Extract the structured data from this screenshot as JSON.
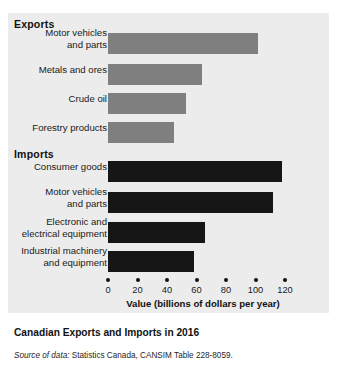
{
  "caption": "Canadian Exports and Imports in 2016",
  "source": {
    "lead": "Source of data:",
    "text": " Statistics Canada, CANSIM Table 228-8059."
  },
  "groups": {
    "exports_label": "Exports",
    "imports_label": "Imports"
  },
  "axis": {
    "title": "Value (billions of dollars per year)",
    "ticks": [
      "0",
      "20",
      "40",
      "60",
      "80",
      "100",
      "120"
    ]
  },
  "colors": {
    "panel": "#ececec",
    "export_bar": "#7f7f7f",
    "import_bar": "#161616",
    "text": "#1a1a1a"
  },
  "chart_data": {
    "type": "bar",
    "orientation": "horizontal",
    "title": "Canadian Exports and Imports in 2016",
    "xlabel": "Value (billions of dollars per year)",
    "ylabel": "",
    "xlim": [
      0,
      120
    ],
    "xticks": [
      0,
      20,
      40,
      60,
      80,
      100,
      120
    ],
    "grid": false,
    "legend": "none",
    "units": "billions of dollars per year",
    "series": [
      {
        "name": "Exports",
        "color": "#7f7f7f",
        "categories": [
          "Motor vehicles\nand parts",
          "Metals and ores",
          "Crude oil",
          "Forestry products"
        ],
        "values": [
          102,
          64,
          53,
          45
        ]
      },
      {
        "name": "Imports",
        "color": "#161616",
        "categories": [
          "Consumer goods",
          "Motor vehicles\nand parts",
          "Electronic and\nelectrical equipment",
          "Industrial machinery\nand equipment"
        ],
        "values": [
          118,
          112,
          66,
          58
        ]
      }
    ]
  }
}
